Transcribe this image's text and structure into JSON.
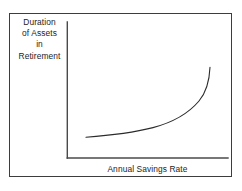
{
  "figure": {
    "kind": "line-chart-schematic",
    "background_color": "#ffffff",
    "frame_color": "#3d3d3d",
    "axis_color": "#4a4a4a",
    "curve_color": "#2b2b2b"
  },
  "y_axis_label": {
    "lines": [
      "Duration",
      "of Assets",
      "in",
      "Retirement"
    ],
    "full_text": "Duration of Assets in Retirement"
  },
  "x_axis_label": {
    "text": "Annual Savings Rate"
  },
  "chart_data": {
    "type": "line",
    "title": "",
    "subtitle": "",
    "xlabel": "Annual Savings Rate",
    "ylabel": "Duration of Assets in Retirement",
    "xlim": [
      0,
      100
    ],
    "ylim": [
      0,
      100
    ],
    "grid": false,
    "legend": null,
    "axis_ticks": {
      "x": [],
      "y": []
    },
    "annotations": [],
    "series": [
      {
        "name": "Duration of assets",
        "x": [
          12,
          20,
          30,
          40,
          50,
          60,
          70,
          80,
          88,
          94,
          100
        ],
        "y": [
          15,
          16,
          19,
          23,
          28,
          34,
          42,
          53,
          64,
          75,
          89
        ]
      }
    ],
    "curve_path_px": "M 86 137.2 C 110 135.4, 134 132.4, 153 127.6 C 172 122.6, 188 114.0, 199 101.0 C 206.5 92.0, 209.5 79.0, 210 67.2",
    "axes_px": {
      "y_axis": {
        "x": 67.3,
        "y_top": 22,
        "y_bottom": 158
      },
      "x_axis": {
        "y": 158,
        "x_left": 67.3,
        "x_right": 228
      }
    }
  }
}
